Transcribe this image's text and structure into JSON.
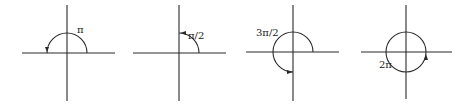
{
  "figure": {
    "diagrams": [
      {
        "label": "π",
        "angle": "pi",
        "description": "half turn counterclockwise"
      },
      {
        "label": "π/2",
        "angle": "pi/2",
        "description": "quarter turn counterclockwise"
      },
      {
        "label": "3π/2",
        "angle": "3pi/2",
        "description": "three-quarter turn counterclockwise"
      },
      {
        "label": "2π",
        "angle": "2pi",
        "description": "full turn counterclockwise"
      }
    ]
  },
  "colors": {
    "stroke": "#2a2a2a",
    "background": "#ffffff"
  }
}
